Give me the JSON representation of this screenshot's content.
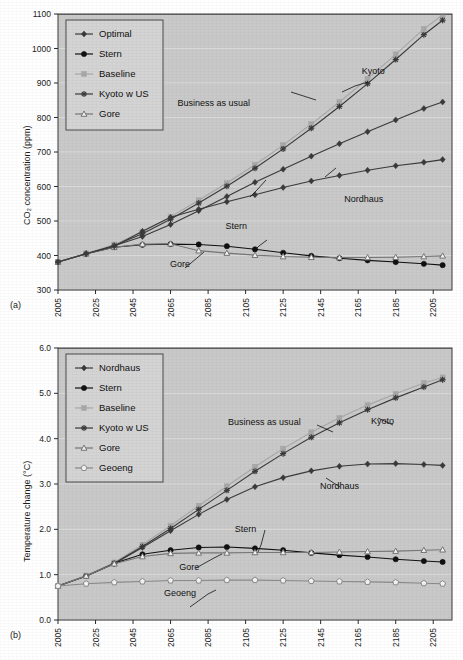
{
  "figure": {
    "panel_a_label": "(a)",
    "panel_b_label": "(b)"
  },
  "chart_data": [
    {
      "id": "panel-a",
      "type": "line",
      "title": "",
      "xlabel": "",
      "ylabel": "CO₂ concentration (ppm)",
      "ylabel_plain": "CO2 concentration (ppm)",
      "xlim": [
        2005,
        2215
      ],
      "ylim": [
        300,
        1100
      ],
      "yticks": [
        "300",
        "400",
        "500",
        "600",
        "700",
        "800",
        "900",
        "1000",
        "1100"
      ],
      "ytick_values": [
        300,
        400,
        500,
        600,
        700,
        800,
        900,
        1000,
        1100
      ],
      "xticks": [
        "2005",
        "2025",
        "2045",
        "2065",
        "2085",
        "2105",
        "2125",
        "2145",
        "2165",
        "2185",
        "2205"
      ],
      "xtick_values": [
        2005,
        2025,
        2045,
        2065,
        2085,
        2105,
        2125,
        2145,
        2165,
        2185,
        2205
      ],
      "grid": "horizontal",
      "legend_position": "top-left",
      "legend": [
        {
          "label": "Optimal",
          "marker": "diamond",
          "color": "#3a3a3a"
        },
        {
          "label": "Stern",
          "marker": "circle",
          "color": "#111111"
        },
        {
          "label": "Baseline",
          "marker": "square",
          "color": "#a8a8a8"
        },
        {
          "label": "Kyoto w US",
          "marker": "star",
          "color": "#3a3a3a"
        },
        {
          "label": "Gore",
          "marker": "triangle",
          "color": "#767676"
        }
      ],
      "annotations": [
        {
          "text": "Kyoto",
          "x": 2173,
          "y": 925
        },
        {
          "text": "Business as usual",
          "x": 2088,
          "y": 832
        },
        {
          "text": "Nordhaus",
          "x": 2168,
          "y": 556
        },
        {
          "text": "Stern",
          "x": 2100,
          "y": 478
        },
        {
          "text": "Gore",
          "x": 2070,
          "y": 368
        }
      ],
      "x": [
        2005,
        2020,
        2035,
        2050,
        2065,
        2080,
        2095,
        2110,
        2125,
        2140,
        2155,
        2170,
        2185,
        2200,
        2210
      ],
      "series": [
        {
          "name": "Optimal",
          "marker": "diamond",
          "color": "#3a3a3a",
          "values": [
            381,
            405,
            428,
            455,
            490,
            530,
            571,
            612,
            650,
            688,
            724,
            759,
            793,
            826,
            845
          ]
        },
        {
          "name": "Stern",
          "marker": "circle",
          "color": "#111111",
          "values": [
            381,
            405,
            424,
            431,
            433,
            432,
            427,
            418,
            408,
            399,
            392,
            386,
            381,
            376,
            372
          ]
        },
        {
          "name": "Baseline",
          "marker": "square",
          "color": "#a8a8a8",
          "values": [
            381,
            406,
            432,
            468,
            512,
            560,
            610,
            663,
            720,
            781,
            845,
            912,
            983,
            1057,
            1097
          ]
        },
        {
          "name": "Kyoto w US",
          "marker": "star",
          "color": "#3a3a3a",
          "values": [
            381,
            405,
            429,
            463,
            505,
            552,
            601,
            653,
            709,
            769,
            832,
            898,
            968,
            1040,
            1082
          ]
        },
        {
          "name": "Gore",
          "marker": "triangle",
          "color": "#767676",
          "values": [
            381,
            405,
            424,
            433,
            434,
            414,
            407,
            401,
            397,
            395,
            394,
            394,
            395,
            397,
            399
          ]
        },
        {
          "name": "Nordhaus",
          "marker": "diamond",
          "color": "#3a3a3a",
          "values": [
            381,
            405,
            427,
            470,
            511,
            534,
            556,
            576,
            597,
            616,
            632,
            647,
            660,
            670,
            678
          ]
        }
      ],
      "series_note": "Nordhaus is the lower interior diamond curve peaking near 680 ppm around 2180 then falling to about 648 ppm at 2210."
    },
    {
      "id": "panel-b",
      "type": "line",
      "title": "",
      "xlabel": "",
      "ylabel": "Temperature change (°C)",
      "ylabel_plain": "Temperature change (C)",
      "xlim": [
        2005,
        2215
      ],
      "ylim": [
        0.0,
        6.0
      ],
      "yticks": [
        "0.0",
        "1.0",
        "2.0",
        "3.0",
        "4.0",
        "5.0",
        "6.0"
      ],
      "ytick_values": [
        0.0,
        1.0,
        2.0,
        3.0,
        4.0,
        5.0,
        6.0
      ],
      "xticks": [
        "2005",
        "2025",
        "2045",
        "2065",
        "2085",
        "2105",
        "2125",
        "2145",
        "2165",
        "2185",
        "2205"
      ],
      "xtick_values": [
        2005,
        2025,
        2045,
        2065,
        2085,
        2105,
        2125,
        2145,
        2165,
        2185,
        2205
      ],
      "grid": "horizontal",
      "legend_position": "top-left",
      "legend": [
        {
          "label": "Nordhaus",
          "marker": "diamond",
          "color": "#3a3a3a"
        },
        {
          "label": "Stern",
          "marker": "circle",
          "color": "#111111"
        },
        {
          "label": "Baseline",
          "marker": "square",
          "color": "#a8a8a8"
        },
        {
          "label": "Kyoto w US",
          "marker": "star",
          "color": "#3a3a3a"
        },
        {
          "label": "Gore",
          "marker": "triangle",
          "color": "#767676"
        },
        {
          "label": "Geoeng",
          "marker": "pentagon",
          "color": "#8a8a8a"
        }
      ],
      "annotations": [
        {
          "text": "Business as usual",
          "x": 2115,
          "y": 4.3
        },
        {
          "text": "Kyoto",
          "x": 2178,
          "y": 4.32
        },
        {
          "text": "Nordhaus",
          "x": 2155,
          "y": 2.88
        },
        {
          "text": "Stern",
          "x": 2105,
          "y": 1.95
        },
        {
          "text": "Gore",
          "x": 2075,
          "y": 1.1
        },
        {
          "text": "Geoeng",
          "x": 2070,
          "y": 0.52
        }
      ],
      "x": [
        2005,
        2020,
        2035,
        2050,
        2065,
        2080,
        2095,
        2110,
        2125,
        2140,
        2155,
        2170,
        2185,
        2200,
        2210
      ],
      "series": [
        {
          "name": "Nordhaus",
          "marker": "diamond",
          "color": "#3a3a3a",
          "values": [
            0.75,
            0.97,
            1.24,
            1.6,
            1.97,
            2.33,
            2.66,
            2.94,
            3.14,
            3.29,
            3.39,
            3.44,
            3.45,
            3.43,
            3.41
          ]
        },
        {
          "name": "Stern",
          "marker": "circle",
          "color": "#111111",
          "values": [
            0.75,
            0.97,
            1.25,
            1.45,
            1.54,
            1.6,
            1.61,
            1.58,
            1.54,
            1.48,
            1.43,
            1.39,
            1.34,
            1.3,
            1.28
          ]
        },
        {
          "name": "Baseline",
          "marker": "square",
          "color": "#a8a8a8",
          "values": [
            0.75,
            0.98,
            1.27,
            1.66,
            2.08,
            2.52,
            2.95,
            3.38,
            3.78,
            4.14,
            4.46,
            4.74,
            4.99,
            5.23,
            5.35
          ]
        },
        {
          "name": "Kyoto w US",
          "marker": "star",
          "color": "#3a3a3a",
          "values": [
            0.75,
            0.97,
            1.25,
            1.62,
            2.02,
            2.44,
            2.86,
            3.28,
            3.67,
            4.03,
            4.35,
            4.64,
            4.9,
            5.14,
            5.3
          ]
        },
        {
          "name": "Gore",
          "marker": "triangle",
          "color": "#767676",
          "values": [
            0.75,
            0.97,
            1.24,
            1.4,
            1.47,
            1.48,
            1.48,
            1.49,
            1.49,
            1.49,
            1.5,
            1.51,
            1.52,
            1.54,
            1.55
          ]
        },
        {
          "name": "Geoeng",
          "marker": "pentagon",
          "color": "#8a8a8a",
          "values": [
            0.75,
            0.8,
            0.83,
            0.85,
            0.87,
            0.87,
            0.88,
            0.88,
            0.87,
            0.86,
            0.85,
            0.84,
            0.83,
            0.81,
            0.8
          ]
        }
      ]
    }
  ]
}
